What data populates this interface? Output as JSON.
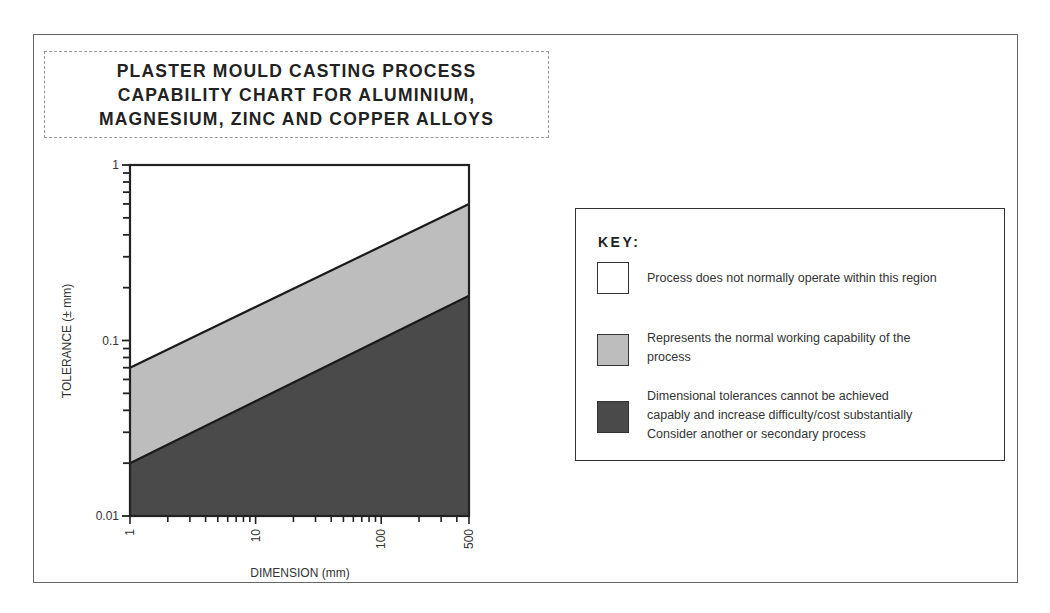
{
  "title": {
    "lines": [
      "PLASTER MOULD CASTING PROCESS",
      "CAPABILITY CHART FOR ALUMINIUM,",
      "MAGNESIUM, ZINC AND COPPER ALLOYS"
    ]
  },
  "chart_data": {
    "type": "area",
    "title": "PLASTER MOULD CASTING PROCESS CAPABILITY CHART FOR ALUMINIUM, MAGNESIUM, ZINC AND COPPER ALLOYS",
    "xlabel": "DIMENSION (mm)",
    "ylabel": "TOLERANCE (± mm)",
    "xscale": "log",
    "yscale": "log",
    "xlim": [
      1,
      500
    ],
    "ylim": [
      0.01,
      1
    ],
    "x_ticks": [
      "1",
      "10",
      "100",
      "500"
    ],
    "y_ticks": [
      "0.01",
      "0.1",
      "1"
    ],
    "grid": false,
    "legend_position": "right",
    "series": [
      {
        "name": "Upper boundary (normal capability upper limit)",
        "x": [
          1,
          500
        ],
        "y": [
          0.07,
          0.6
        ]
      },
      {
        "name": "Lower boundary (normal capability lower limit)",
        "x": [
          1,
          500
        ],
        "y": [
          0.02,
          0.18
        ]
      }
    ],
    "regions": [
      {
        "name": "Process does not normally operate within this region",
        "fill": "#ffffff",
        "position": "above upper boundary"
      },
      {
        "name": "Represents the normal working capability of the process",
        "fill": "#bdbdbd",
        "position": "between boundaries"
      },
      {
        "name": "Dimensional tolerances cannot be achieved capably and increase difficulty/cost substantially Consider another or secondary process",
        "fill": "#4a4a4a",
        "position": "below lower boundary"
      }
    ]
  },
  "axes": {
    "xlabel": "DIMENSION (mm)",
    "ylabel": "TOLERANCE (± mm)",
    "x_ticks": [
      "1",
      "10",
      "100",
      "500"
    ],
    "y_ticks": [
      "1",
      "0.1",
      "0.01"
    ]
  },
  "legend": {
    "title": "KEY:",
    "items": [
      {
        "color": "#ffffff",
        "lines": [
          "Process does not normally operate within this region"
        ]
      },
      {
        "color": "#bdbdbd",
        "lines": [
          "Represents the normal working capability of the",
          "process"
        ]
      },
      {
        "color": "#4a4a4a",
        "lines": [
          "Dimensional tolerances cannot be achieved",
          "capably and increase difficulty/cost substantially",
          "Consider another or secondary process"
        ]
      }
    ]
  }
}
